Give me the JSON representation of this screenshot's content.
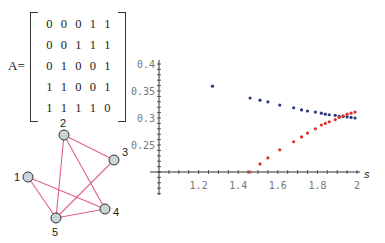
{
  "matrix": {
    "label": "A=",
    "rows": [
      [
        "0",
        "0",
        "0",
        "1",
        "1"
      ],
      [
        "0",
        "0",
        "1",
        "1",
        "1"
      ],
      [
        "0",
        "1",
        "0",
        "0",
        "1"
      ],
      [
        "1",
        "1",
        "0",
        "0",
        "1"
      ],
      [
        "1",
        "1",
        "1",
        "1",
        "0"
      ]
    ]
  },
  "graph": {
    "nodes": [
      {
        "id": "1",
        "x": 28,
        "y": 177,
        "lx": 14,
        "ly": 181
      },
      {
        "id": "2",
        "x": 64,
        "y": 135,
        "lx": 60,
        "ly": 127
      },
      {
        "id": "3",
        "x": 114,
        "y": 160,
        "lx": 122,
        "ly": 156
      },
      {
        "id": "4",
        "x": 105,
        "y": 209,
        "lx": 113,
        "ly": 216
      },
      {
        "id": "5",
        "x": 56,
        "y": 218,
        "lx": 52,
        "ly": 236
      }
    ],
    "edges": [
      [
        "1",
        "4"
      ],
      [
        "1",
        "5"
      ],
      [
        "2",
        "3"
      ],
      [
        "2",
        "4"
      ],
      [
        "2",
        "5"
      ],
      [
        "3",
        "5"
      ],
      [
        "4",
        "5"
      ]
    ],
    "edge_color": "#e0608a",
    "node_fill": "#c8d4d8"
  },
  "chart_data": {
    "type": "scatter",
    "title": "",
    "xlabel": "s",
    "ylabel": "",
    "xlim": [
      1.0,
      2.0
    ],
    "ylim": [
      0.2,
      0.4
    ],
    "x_ticks": [
      "1.2",
      "1.4",
      "1.6",
      "1.8",
      "2"
    ],
    "y_ticks": [
      "0.25",
      "0.3",
      "0.35",
      "0.4"
    ],
    "series": [
      {
        "name": "blue",
        "color": "#2a3a7a",
        "points": [
          [
            1.27,
            0.359
          ],
          [
            1.46,
            0.337
          ],
          [
            1.51,
            0.333
          ],
          [
            1.55,
            0.33
          ],
          [
            1.61,
            0.324
          ],
          [
            1.68,
            0.319
          ],
          [
            1.72,
            0.315
          ],
          [
            1.75,
            0.313
          ],
          [
            1.79,
            0.311
          ],
          [
            1.82,
            0.309
          ],
          [
            1.84,
            0.307
          ],
          [
            1.86,
            0.306
          ],
          [
            1.89,
            0.305
          ],
          [
            1.91,
            0.303
          ],
          [
            1.93,
            0.303
          ],
          [
            1.95,
            0.302
          ],
          [
            1.97,
            0.301
          ],
          [
            1.99,
            0.3
          ]
        ]
      },
      {
        "name": "red",
        "color": "#e03030",
        "points": [
          [
            1.46,
            0.2
          ],
          [
            1.51,
            0.215
          ],
          [
            1.55,
            0.226
          ],
          [
            1.61,
            0.241
          ],
          [
            1.68,
            0.256
          ],
          [
            1.72,
            0.265
          ],
          [
            1.75,
            0.272
          ],
          [
            1.79,
            0.28
          ],
          [
            1.82,
            0.287
          ],
          [
            1.84,
            0.29
          ],
          [
            1.86,
            0.293
          ],
          [
            1.89,
            0.297
          ],
          [
            1.91,
            0.301
          ],
          [
            1.93,
            0.304
          ],
          [
            1.95,
            0.307
          ],
          [
            1.97,
            0.309
          ],
          [
            1.99,
            0.311
          ]
        ]
      }
    ]
  }
}
